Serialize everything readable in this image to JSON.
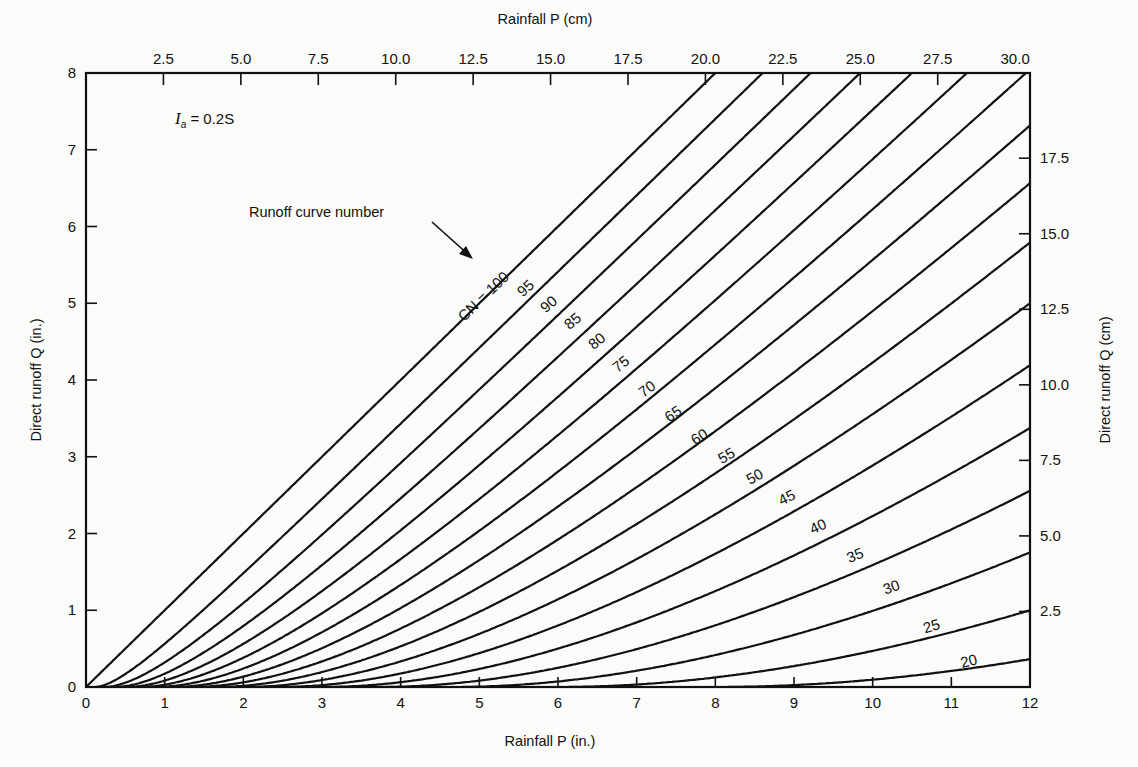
{
  "chart_data": {
    "type": "line",
    "title": "",
    "annotation_formula": "I_a = 0.2S",
    "annotation_formula_parts": {
      "symbol": "I",
      "subscript": "a",
      "rest": " = 0.2S"
    },
    "annotation_pointer": "Runoff curve number",
    "xlabel": "Rainfall P (in.)",
    "xlabel_top": "Rainfall P (cm)",
    "ylabel": "Direct runoff Q (in.)",
    "ylabel_right": "Direct runoff Q (cm)",
    "xlim": [
      0,
      12
    ],
    "ylim": [
      0,
      8
    ],
    "x_ticks": [
      "0",
      "1",
      "2",
      "3",
      "4",
      "5",
      "6",
      "7",
      "8",
      "9",
      "10",
      "11",
      "12"
    ],
    "y_ticks": [
      "0",
      "1",
      "2",
      "3",
      "4",
      "5",
      "6",
      "7",
      "8"
    ],
    "x_top_ticks": [
      "2.5",
      "5.0",
      "7.5",
      "10.0",
      "12.5",
      "15.0",
      "17.5",
      "20.0",
      "22.5",
      "25.0",
      "27.5",
      "30.0"
    ],
    "y_right_ticks": [
      "2.5",
      "5.0",
      "7.5",
      "10.0",
      "12.5",
      "15.0",
      "17.5"
    ],
    "grid": false,
    "legend": "none (curves labeled inline)",
    "series_label_prefix_first": "CN = ",
    "series": [
      {
        "name": "100",
        "label": "CN = 100",
        "x": [
          0,
          2,
          4,
          6,
          8,
          10,
          10.4
        ],
        "y": [
          0,
          2,
          4,
          6,
          8,
          8,
          8
        ]
      },
      {
        "name": "95",
        "label": "95",
        "x": [
          0,
          1,
          2,
          4,
          6,
          8,
          10.7
        ],
        "y": [
          0,
          0.56,
          1.43,
          3.3,
          5.24,
          7.21,
          8
        ]
      },
      {
        "name": "90",
        "label": "90",
        "x": [
          0,
          1,
          2,
          4,
          6,
          8,
          11.1
        ],
        "y": [
          0,
          0.26,
          0.96,
          2.7,
          4.56,
          6.48,
          8
        ]
      },
      {
        "name": "85",
        "label": "85",
        "x": [
          0,
          1,
          2,
          4,
          6,
          8,
          11.5
        ],
        "y": [
          0,
          0.08,
          0.59,
          2.15,
          3.92,
          5.78,
          8
        ]
      },
      {
        "name": "80",
        "label": "80",
        "x": [
          0,
          1,
          2,
          4,
          6,
          8,
          12
        ],
        "y": [
          0,
          0,
          0.35,
          1.67,
          3.28,
          5.09,
          7.99
        ]
      },
      {
        "name": "75",
        "label": "75",
        "x": [
          0,
          2,
          4,
          6,
          8,
          10,
          12
        ],
        "y": [
          0,
          0.17,
          1.26,
          2.71,
          4.44,
          6.27,
          7.44
        ]
      },
      {
        "name": "70",
        "label": "70",
        "x": [
          0,
          2,
          4,
          6,
          8,
          10,
          12
        ],
        "y": [
          0,
          0.06,
          0.93,
          2.22,
          3.82,
          5.53,
          7.29
        ]
      },
      {
        "name": "65",
        "label": "65",
        "x": [
          0,
          2,
          4,
          6,
          8,
          10,
          12
        ],
        "y": [
          0,
          0.01,
          0.66,
          1.77,
          3.23,
          4.84,
          6.53
        ]
      },
      {
        "name": "60",
        "label": "60",
        "x": [
          0,
          2,
          4,
          6,
          8,
          10,
          12
        ],
        "y": [
          0,
          0,
          0.42,
          1.38,
          2.69,
          4.18,
          5.79
        ]
      },
      {
        "name": "55",
        "label": "55",
        "x": [
          0,
          2,
          4,
          6,
          8,
          10,
          12
        ],
        "y": [
          0,
          0,
          0.25,
          1.04,
          2.2,
          3.57,
          5.08
        ]
      },
      {
        "name": "50",
        "label": "50",
        "x": [
          0,
          2,
          4,
          6,
          8,
          10,
          12
        ],
        "y": [
          0,
          0,
          0.12,
          0.74,
          1.75,
          3.0,
          4.41
        ]
      },
      {
        "name": "45",
        "label": "45",
        "x": [
          0,
          2,
          4,
          6,
          8,
          10,
          12
        ],
        "y": [
          0,
          0,
          0.04,
          0.49,
          1.33,
          2.44,
          3.75
        ]
      },
      {
        "name": "40",
        "label": "40",
        "x": [
          0,
          2,
          4,
          6,
          8,
          10,
          12
        ],
        "y": [
          0,
          0,
          0,
          0.28,
          0.96,
          1.93,
          3.13
        ]
      },
      {
        "name": "35",
        "label": "35",
        "x": [
          0,
          4,
          6,
          8,
          10,
          12
        ],
        "y": [
          0,
          0,
          0.13,
          0.63,
          1.45,
          2.53
        ]
      },
      {
        "name": "30",
        "label": "30",
        "x": [
          0,
          4,
          6,
          8,
          10,
          12
        ],
        "y": [
          0,
          0,
          0.03,
          0.35,
          1.01,
          1.95
        ]
      },
      {
        "name": "25",
        "label": "25",
        "x": [
          0,
          6,
          8,
          10,
          12
        ],
        "y": [
          0,
          0,
          0.14,
          0.61,
          1.39
        ]
      },
      {
        "name": "20",
        "label": "20",
        "x": [
          0,
          8,
          10,
          12
        ],
        "y": [
          0,
          0.01,
          0.28,
          0.86
        ]
      }
    ]
  }
}
